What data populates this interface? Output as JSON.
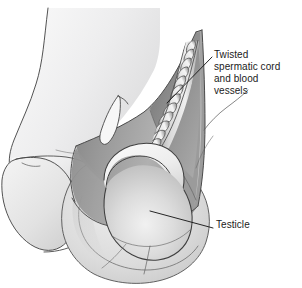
{
  "figure": {
    "background_color": "#ffffff",
    "width": 302,
    "height": 288
  },
  "labels": {
    "cord": {
      "text": "Twisted\nspermatic cord\nand blood\nvessels",
      "lines": [
        "Twisted",
        "spermatic cord",
        "and blood",
        "vessels"
      ],
      "color": "#1b1b1b"
    },
    "testicle": {
      "text": "Testicle",
      "lines": [
        "Testicle"
      ],
      "color": "#1b1b1b"
    }
  },
  "leader_lines": {
    "cord_leader": {
      "from_x": 212,
      "from_y": 57,
      "to_x": 167,
      "to_y": 103,
      "color": "#1b1b1b"
    },
    "testicle_leader": {
      "from_x": 213,
      "from_y": 228,
      "to_x": 150,
      "to_y": 211,
      "color": "#1b1b1b"
    }
  },
  "palette": {
    "outline": "#4a4a4a",
    "outline_dark": "#333333",
    "skin_light": "#ececed",
    "skin_mid": "#dedede",
    "scrotum_light": "#d6d6d6",
    "flap_dark": "#8d8d8d",
    "flap_mid": "#a3a3a3",
    "flap_light": "#c4c4c4",
    "testicle_light": "#e8e8e8",
    "testicle_mid": "#c9c9c9",
    "epididymis": "#f2f2f2",
    "cord_light": "#e2e2e2",
    "cord_mid": "#b5b5b5"
  },
  "parts": [
    {
      "name": "body-torso-outline",
      "description": "Lower abdomen and thigh contour, upper left"
    },
    {
      "name": "penis-shaft",
      "description": "Shaft drawn at left, angled down-left"
    },
    {
      "name": "penis-glans",
      "description": "Rounded glans at lower left"
    },
    {
      "name": "scrotal-sac",
      "description": "Large pale scrotal sac, lower centre"
    },
    {
      "name": "scrotal-wall-flap",
      "description": "Opened dark grey scrotal wall flap sweeping up to the right"
    },
    {
      "name": "spermatic-cord-twist",
      "description": "Helical twisted spermatic cord and blood vessels"
    },
    {
      "name": "testicle",
      "description": "Testicle seen through the opened scrotum"
    },
    {
      "name": "epididymis",
      "description": "Pale crescent arching over the top of the testicle"
    },
    {
      "name": "suture-loop",
      "description": "Thin pointed loop above the scrotum"
    }
  ]
}
